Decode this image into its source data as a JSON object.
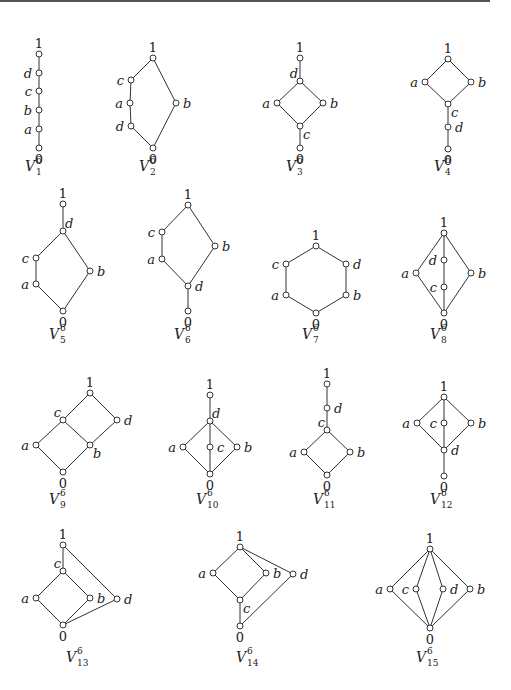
{
  "figure": {
    "caption_base": "V",
    "caption_sup": "6"
  },
  "lattices": [
    {
      "name": "V1",
      "sub": "1",
      "caption_pos": [
        39,
        164
      ],
      "nodes": [
        {
          "id": "1",
          "x": 39,
          "y": 54,
          "label": "1",
          "lpos": "top"
        },
        {
          "id": "d",
          "x": 39,
          "y": 73,
          "label": "d",
          "lpos": "left"
        },
        {
          "id": "c",
          "x": 39,
          "y": 91,
          "label": "c",
          "lpos": "left"
        },
        {
          "id": "b",
          "x": 39,
          "y": 110,
          "label": "b",
          "lpos": "left"
        },
        {
          "id": "a",
          "x": 39,
          "y": 129,
          "label": "a",
          "lpos": "left"
        },
        {
          "id": "0",
          "x": 39,
          "y": 148,
          "label": "0",
          "lpos": "bottom"
        }
      ],
      "edges": [
        [
          "1",
          "d"
        ],
        [
          "d",
          "c"
        ],
        [
          "c",
          "b"
        ],
        [
          "b",
          "a"
        ],
        [
          "a",
          "0"
        ]
      ]
    },
    {
      "name": "V2",
      "sub": "2",
      "caption_pos": [
        153,
        164
      ],
      "nodes": [
        {
          "id": "1",
          "x": 153,
          "y": 58,
          "label": "1",
          "lpos": "top"
        },
        {
          "id": "c",
          "x": 131,
          "y": 80,
          "label": "c",
          "lpos": "left"
        },
        {
          "id": "a",
          "x": 130,
          "y": 103,
          "label": "a",
          "lpos": "left"
        },
        {
          "id": "d",
          "x": 131,
          "y": 126,
          "label": "d",
          "lpos": "left"
        },
        {
          "id": "b",
          "x": 176,
          "y": 103,
          "label": "b",
          "lpos": "right"
        },
        {
          "id": "0",
          "x": 153,
          "y": 148,
          "label": "0",
          "lpos": "bottom"
        }
      ],
      "edges": [
        [
          "1",
          "c"
        ],
        [
          "c",
          "a"
        ],
        [
          "a",
          "d"
        ],
        [
          "d",
          "0"
        ],
        [
          "1",
          "b"
        ],
        [
          "b",
          "0"
        ]
      ]
    },
    {
      "name": "V3",
      "sub": "3",
      "caption_pos": [
        300,
        164
      ],
      "nodes": [
        {
          "id": "1",
          "x": 300,
          "y": 58,
          "label": "1",
          "lpos": "top"
        },
        {
          "id": "d",
          "x": 300,
          "y": 81,
          "label": "d",
          "lpos": "topleft"
        },
        {
          "id": "a",
          "x": 277,
          "y": 103,
          "label": "a",
          "lpos": "left"
        },
        {
          "id": "b",
          "x": 323,
          "y": 103,
          "label": "b",
          "lpos": "right"
        },
        {
          "id": "c",
          "x": 300,
          "y": 126,
          "label": "c",
          "lpos": "bottomright"
        },
        {
          "id": "0",
          "x": 300,
          "y": 148,
          "label": "0",
          "lpos": "bottom"
        }
      ],
      "edges": [
        [
          "1",
          "d"
        ],
        [
          "d",
          "a"
        ],
        [
          "d",
          "b"
        ],
        [
          "a",
          "c"
        ],
        [
          "b",
          "c"
        ],
        [
          "c",
          "0"
        ]
      ]
    },
    {
      "name": "V4",
      "sub": "4",
      "caption_pos": [
        448,
        164
      ],
      "nodes": [
        {
          "id": "1",
          "x": 448,
          "y": 59,
          "label": "1",
          "lpos": "top"
        },
        {
          "id": "a",
          "x": 425,
          "y": 82,
          "label": "a",
          "lpos": "left"
        },
        {
          "id": "b",
          "x": 471,
          "y": 82,
          "label": "b",
          "lpos": "right"
        },
        {
          "id": "c",
          "x": 448,
          "y": 104,
          "label": "c",
          "lpos": "bottomright"
        },
        {
          "id": "d",
          "x": 448,
          "y": 127,
          "label": "d",
          "lpos": "right"
        },
        {
          "id": "0",
          "x": 448,
          "y": 149,
          "label": "0",
          "lpos": "bottom"
        }
      ],
      "edges": [
        [
          "1",
          "a"
        ],
        [
          "1",
          "b"
        ],
        [
          "a",
          "c"
        ],
        [
          "b",
          "c"
        ],
        [
          "c",
          "d"
        ],
        [
          "d",
          "0"
        ]
      ]
    },
    {
      "name": "V5",
      "sub": "5",
      "caption_pos": [
        63,
        332
      ],
      "nodes": [
        {
          "id": "1",
          "x": 63,
          "y": 204,
          "label": "1",
          "lpos": "top"
        },
        {
          "id": "d",
          "x": 63,
          "y": 231,
          "label": "d",
          "lpos": "topright"
        },
        {
          "id": "c",
          "x": 36,
          "y": 258,
          "label": "c",
          "lpos": "left"
        },
        {
          "id": "a",
          "x": 36,
          "y": 284,
          "label": "a",
          "lpos": "left"
        },
        {
          "id": "b",
          "x": 90,
          "y": 271,
          "label": "b",
          "lpos": "right"
        },
        {
          "id": "0",
          "x": 63,
          "y": 311,
          "label": "0",
          "lpos": "bottom"
        }
      ],
      "edges": [
        [
          "1",
          "d"
        ],
        [
          "d",
          "c"
        ],
        [
          "c",
          "a"
        ],
        [
          "a",
          "0"
        ],
        [
          "d",
          "b"
        ],
        [
          "b",
          "0"
        ]
      ]
    },
    {
      "name": "V6",
      "sub": "6",
      "caption_pos": [
        188,
        332
      ],
      "nodes": [
        {
          "id": "1",
          "x": 188,
          "y": 205,
          "label": "1",
          "lpos": "top"
        },
        {
          "id": "c",
          "x": 162,
          "y": 232,
          "label": "c",
          "lpos": "left"
        },
        {
          "id": "a",
          "x": 162,
          "y": 259,
          "label": "a",
          "lpos": "left"
        },
        {
          "id": "b",
          "x": 215,
          "y": 246,
          "label": "b",
          "lpos": "right"
        },
        {
          "id": "d",
          "x": 188,
          "y": 286,
          "label": "d",
          "lpos": "right"
        },
        {
          "id": "0",
          "x": 188,
          "y": 311,
          "label": "0",
          "lpos": "bottom"
        }
      ],
      "edges": [
        [
          "1",
          "c"
        ],
        [
          "c",
          "a"
        ],
        [
          "a",
          "d"
        ],
        [
          "1",
          "b"
        ],
        [
          "b",
          "d"
        ],
        [
          "d",
          "0"
        ]
      ]
    },
    {
      "name": "V7",
      "sub": "7",
      "caption_pos": [
        316,
        332
      ],
      "nodes": [
        {
          "id": "1",
          "x": 316,
          "y": 246,
          "label": "1",
          "lpos": "top"
        },
        {
          "id": "c",
          "x": 286,
          "y": 264,
          "label": "c",
          "lpos": "left"
        },
        {
          "id": "d",
          "x": 346,
          "y": 264,
          "label": "d",
          "lpos": "right"
        },
        {
          "id": "a",
          "x": 286,
          "y": 295,
          "label": "a",
          "lpos": "left"
        },
        {
          "id": "b",
          "x": 346,
          "y": 295,
          "label": "b",
          "lpos": "right"
        },
        {
          "id": "0",
          "x": 316,
          "y": 313,
          "label": "0",
          "lpos": "bottom"
        }
      ],
      "edges": [
        [
          "1",
          "c"
        ],
        [
          "1",
          "d"
        ],
        [
          "c",
          "a"
        ],
        [
          "d",
          "b"
        ],
        [
          "a",
          "0"
        ],
        [
          "b",
          "0"
        ]
      ]
    },
    {
      "name": "V8",
      "sub": "8",
      "caption_pos": [
        444,
        332
      ],
      "nodes": [
        {
          "id": "1",
          "x": 444,
          "y": 233,
          "label": "1",
          "lpos": "top"
        },
        {
          "id": "d",
          "x": 444,
          "y": 260,
          "label": "d",
          "lpos": "left"
        },
        {
          "id": "c",
          "x": 444,
          "y": 287,
          "label": "c",
          "lpos": "left"
        },
        {
          "id": "a",
          "x": 416,
          "y": 273,
          "label": "a",
          "lpos": "left"
        },
        {
          "id": "b",
          "x": 471,
          "y": 273,
          "label": "b",
          "lpos": "right"
        },
        {
          "id": "0",
          "x": 444,
          "y": 313,
          "label": "0",
          "lpos": "bottom"
        }
      ],
      "edges": [
        [
          "1",
          "d"
        ],
        [
          "d",
          "c"
        ],
        [
          "c",
          "0"
        ],
        [
          "1",
          "a"
        ],
        [
          "a",
          "0"
        ],
        [
          "1",
          "b"
        ],
        [
          "b",
          "0"
        ]
      ]
    },
    {
      "name": "V9",
      "sub": "9",
      "caption_pos": [
        63,
        497
      ],
      "nodes": [
        {
          "id": "1",
          "x": 90,
          "y": 393,
          "label": "1",
          "lpos": "top"
        },
        {
          "id": "c",
          "x": 63,
          "y": 420,
          "label": "c",
          "lpos": "topleft"
        },
        {
          "id": "d",
          "x": 117,
          "y": 420,
          "label": "d",
          "lpos": "right"
        },
        {
          "id": "a",
          "x": 36,
          "y": 445,
          "label": "a",
          "lpos": "left"
        },
        {
          "id": "b",
          "x": 90,
          "y": 445,
          "label": "b",
          "lpos": "bottomright"
        },
        {
          "id": "0",
          "x": 63,
          "y": 472,
          "label": "0",
          "lpos": "bottom"
        }
      ],
      "edges": [
        [
          "1",
          "c"
        ],
        [
          "1",
          "d"
        ],
        [
          "c",
          "a"
        ],
        [
          "c",
          "b"
        ],
        [
          "d",
          "b"
        ],
        [
          "a",
          "0"
        ],
        [
          "b",
          "0"
        ]
      ]
    },
    {
      "name": "V10",
      "sub": "10",
      "caption_pos": [
        210,
        497
      ],
      "nodes": [
        {
          "id": "1",
          "x": 210,
          "y": 395,
          "label": "1",
          "lpos": "top"
        },
        {
          "id": "d",
          "x": 210,
          "y": 421,
          "label": "d",
          "lpos": "topright"
        },
        {
          "id": "a",
          "x": 183,
          "y": 447,
          "label": "a",
          "lpos": "left"
        },
        {
          "id": "c",
          "x": 210,
          "y": 447,
          "label": "c",
          "lpos": "right"
        },
        {
          "id": "b",
          "x": 237,
          "y": 447,
          "label": "b",
          "lpos": "right"
        },
        {
          "id": "0",
          "x": 210,
          "y": 474,
          "label": "0",
          "lpos": "bottom"
        }
      ],
      "edges": [
        [
          "1",
          "d"
        ],
        [
          "d",
          "a"
        ],
        [
          "d",
          "c"
        ],
        [
          "d",
          "b"
        ],
        [
          "a",
          "0"
        ],
        [
          "c",
          "0"
        ],
        [
          "b",
          "0"
        ]
      ]
    },
    {
      "name": "V11",
      "sub": "11",
      "caption_pos": [
        327,
        497
      ],
      "nodes": [
        {
          "id": "1",
          "x": 327,
          "y": 384,
          "label": "1",
          "lpos": "top"
        },
        {
          "id": "d",
          "x": 327,
          "y": 408,
          "label": "d",
          "lpos": "right"
        },
        {
          "id": "c",
          "x": 327,
          "y": 430,
          "label": "c",
          "lpos": "topleft"
        },
        {
          "id": "a",
          "x": 304,
          "y": 452,
          "label": "a",
          "lpos": "left"
        },
        {
          "id": "b",
          "x": 350,
          "y": 452,
          "label": "b",
          "lpos": "right"
        },
        {
          "id": "0",
          "x": 327,
          "y": 475,
          "label": "0",
          "lpos": "bottom"
        }
      ],
      "edges": [
        [
          "1",
          "d"
        ],
        [
          "d",
          "c"
        ],
        [
          "c",
          "a"
        ],
        [
          "c",
          "b"
        ],
        [
          "a",
          "0"
        ],
        [
          "b",
          "0"
        ]
      ]
    },
    {
      "name": "V12",
      "sub": "12",
      "caption_pos": [
        444,
        497
      ],
      "nodes": [
        {
          "id": "1",
          "x": 444,
          "y": 397,
          "label": "1",
          "lpos": "top"
        },
        {
          "id": "a",
          "x": 417,
          "y": 423,
          "label": "a",
          "lpos": "left"
        },
        {
          "id": "c",
          "x": 444,
          "y": 423,
          "label": "c",
          "lpos": "left"
        },
        {
          "id": "b",
          "x": 471,
          "y": 423,
          "label": "b",
          "lpos": "right"
        },
        {
          "id": "d",
          "x": 444,
          "y": 450,
          "label": "d",
          "lpos": "right"
        },
        {
          "id": "0",
          "x": 444,
          "y": 476,
          "label": "0",
          "lpos": "bottom"
        }
      ],
      "edges": [
        [
          "1",
          "a"
        ],
        [
          "1",
          "c"
        ],
        [
          "1",
          "b"
        ],
        [
          "a",
          "d"
        ],
        [
          "c",
          "d"
        ],
        [
          "b",
          "d"
        ],
        [
          "d",
          "0"
        ]
      ]
    },
    {
      "name": "V13",
      "sub": "13",
      "caption_pos": [
        80,
        655
      ],
      "nodes": [
        {
          "id": "1",
          "x": 63,
          "y": 545,
          "label": "1",
          "lpos": "top"
        },
        {
          "id": "c",
          "x": 63,
          "y": 571,
          "label": "c",
          "lpos": "topleft"
        },
        {
          "id": "a",
          "x": 36,
          "y": 598,
          "label": "a",
          "lpos": "left"
        },
        {
          "id": "b",
          "x": 90,
          "y": 598,
          "label": "b",
          "lpos": "right"
        },
        {
          "id": "d",
          "x": 117,
          "y": 599,
          "label": "d",
          "lpos": "right"
        },
        {
          "id": "0",
          "x": 63,
          "y": 625,
          "label": "0",
          "lpos": "bottom"
        }
      ],
      "edges": [
        [
          "1",
          "c"
        ],
        [
          "c",
          "a"
        ],
        [
          "c",
          "b"
        ],
        [
          "a",
          "0"
        ],
        [
          "b",
          "0"
        ],
        [
          "1",
          "d"
        ],
        [
          "d",
          "0"
        ]
      ]
    },
    {
      "name": "V14",
      "sub": "14",
      "caption_pos": [
        250,
        655
      ],
      "nodes": [
        {
          "id": "1",
          "x": 240,
          "y": 547,
          "label": "1",
          "lpos": "top"
        },
        {
          "id": "a",
          "x": 213,
          "y": 573,
          "label": "a",
          "lpos": "left"
        },
        {
          "id": "b",
          "x": 266,
          "y": 573,
          "label": "b",
          "lpos": "right"
        },
        {
          "id": "d",
          "x": 293,
          "y": 574,
          "label": "d",
          "lpos": "right"
        },
        {
          "id": "c",
          "x": 240,
          "y": 600,
          "label": "c",
          "lpos": "bottomright"
        },
        {
          "id": "0",
          "x": 240,
          "y": 626,
          "label": "0",
          "lpos": "bottom"
        }
      ],
      "edges": [
        [
          "1",
          "a"
        ],
        [
          "1",
          "b"
        ],
        [
          "a",
          "c"
        ],
        [
          "b",
          "c"
        ],
        [
          "c",
          "0"
        ],
        [
          "1",
          "d"
        ],
        [
          "d",
          "0"
        ]
      ]
    },
    {
      "name": "V15",
      "sub": "15",
      "caption_pos": [
        430,
        655
      ],
      "nodes": [
        {
          "id": "1",
          "x": 430,
          "y": 549,
          "label": "1",
          "lpos": "top"
        },
        {
          "id": "a",
          "x": 390,
          "y": 589,
          "label": "a",
          "lpos": "left"
        },
        {
          "id": "c",
          "x": 416,
          "y": 589,
          "label": "c",
          "lpos": "left"
        },
        {
          "id": "d",
          "x": 443,
          "y": 589,
          "label": "d",
          "lpos": "right"
        },
        {
          "id": "b",
          "x": 470,
          "y": 589,
          "label": "b",
          "lpos": "right"
        },
        {
          "id": "0",
          "x": 430,
          "y": 628,
          "label": "0",
          "lpos": "bottom"
        }
      ],
      "edges": [
        [
          "1",
          "a"
        ],
        [
          "1",
          "c"
        ],
        [
          "1",
          "d"
        ],
        [
          "1",
          "b"
        ],
        [
          "a",
          "0"
        ],
        [
          "c",
          "0"
        ],
        [
          "d",
          "0"
        ],
        [
          "b",
          "0"
        ]
      ]
    }
  ]
}
